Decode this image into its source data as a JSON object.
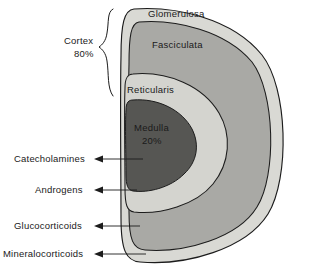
{
  "figure": {
    "zones": [
      {
        "id": "glomerulosa",
        "label": "Glomerulosa",
        "color": "#d9d9d4"
      },
      {
        "id": "fasciculata",
        "label": "Fasciculata",
        "color": "#a9a9a5"
      },
      {
        "id": "reticularis",
        "label": "Reticularis",
        "color": "#d4d4cf"
      },
      {
        "id": "medulla",
        "label": "Medulla",
        "sublabel": "20%",
        "color": "#565653"
      }
    ],
    "bracket": {
      "label": "Cortex",
      "percent": "80%"
    },
    "hormones": [
      {
        "id": "catecholamines",
        "label": "Catecholamines",
        "target": "medulla"
      },
      {
        "id": "androgens",
        "label": "Androgens",
        "target": "reticularis"
      },
      {
        "id": "glucocorticoids",
        "label": "Glucocorticoids",
        "target": "fasciculata"
      },
      {
        "id": "mineralocorticoids",
        "label": "Mineralocorticoids",
        "target": "glomerulosa"
      }
    ],
    "colors": {
      "outline": "#1c1c1c",
      "background": "#ffffff",
      "text": "#1a1a1a"
    }
  }
}
